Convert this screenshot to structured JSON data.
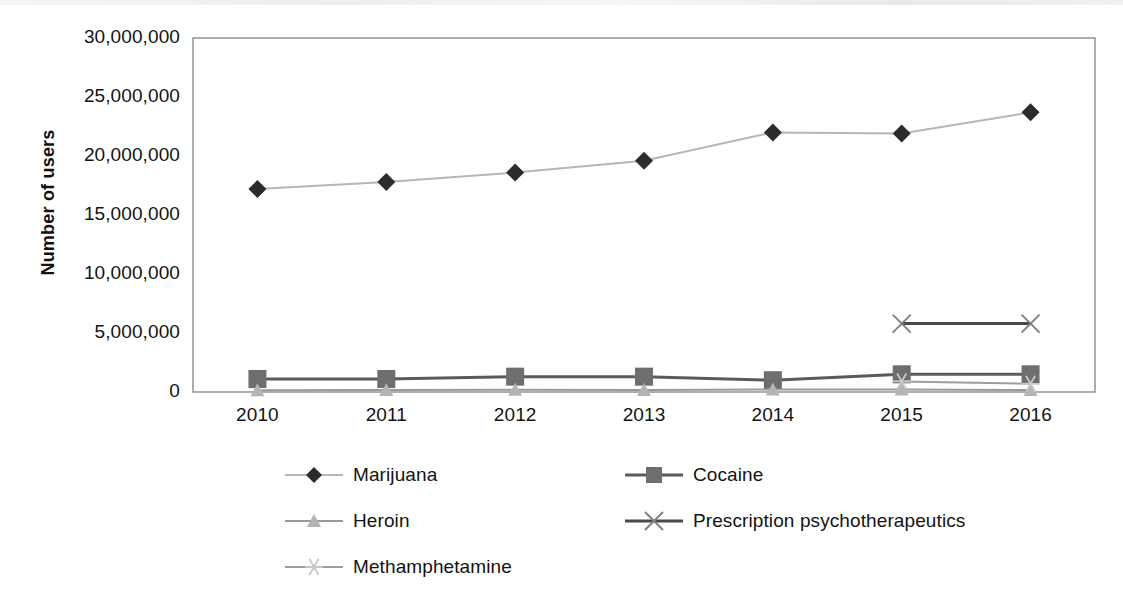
{
  "chart_data": {
    "type": "line",
    "title": "",
    "subtitle": "",
    "xlabel": "",
    "ylabel": "Number of users",
    "categories": [
      "2010",
      "2011",
      "2012",
      "2013",
      "2014",
      "2015",
      "2016"
    ],
    "x_tick_labels": [
      "2010",
      "2011",
      "2012",
      "2013",
      "2014",
      "2015",
      "2016"
    ],
    "y_tick_labels": [
      "0",
      "5,000,000",
      "10,000,000",
      "15,000,000",
      "20,000,000",
      "25,000,000",
      "30,000,000"
    ],
    "y_tick_values": [
      0,
      5000000,
      10000000,
      15000000,
      20000000,
      25000000,
      30000000
    ],
    "ylim": [
      0,
      30000000
    ],
    "grid": false,
    "legend_position": "bottom",
    "series": [
      {
        "name": "Marijuana",
        "marker": "diamond",
        "color": "#2b2b2b",
        "line_color": "#b6b6b6",
        "values": [
          17200000,
          17800000,
          18600000,
          19600000,
          22000000,
          21900000,
          23700000
        ]
      },
      {
        "name": "Cocaine",
        "marker": "square",
        "color": "#6e6e6e",
        "line_color": "#5a5a5a",
        "values": [
          1100000,
          1100000,
          1300000,
          1300000,
          1000000,
          1500000,
          1500000
        ]
      },
      {
        "name": "Heroin",
        "marker": "triangle",
        "color": "#b4b4b4",
        "line_color": "#9a9a9a",
        "values": [
          140000,
          170000,
          190000,
          170000,
          210000,
          210000,
          170000
        ]
      },
      {
        "name": "Prescription psychotherapeutics",
        "marker": "x",
        "color": "#808080",
        "line_color": "#4a4a4a",
        "values": [
          null,
          null,
          null,
          null,
          null,
          5800000,
          5800000
        ]
      },
      {
        "name": "Methamphetamine",
        "marker": "asterisk",
        "color": "#c8c8c8",
        "line_color": "#9d9d9d",
        "values": [
          null,
          null,
          null,
          null,
          null,
          900000,
          700000
        ]
      }
    ]
  },
  "legend": {
    "items": [
      {
        "label": "Marijuana",
        "marker": "diamond"
      },
      {
        "label": "Cocaine",
        "marker": "square"
      },
      {
        "label": "Heroin",
        "marker": "triangle"
      },
      {
        "label": "Prescription psychotherapeutics",
        "marker": "x"
      },
      {
        "label": "Methamphetamine",
        "marker": "asterisk"
      }
    ]
  },
  "axes": {
    "y_title": "Number of users"
  }
}
